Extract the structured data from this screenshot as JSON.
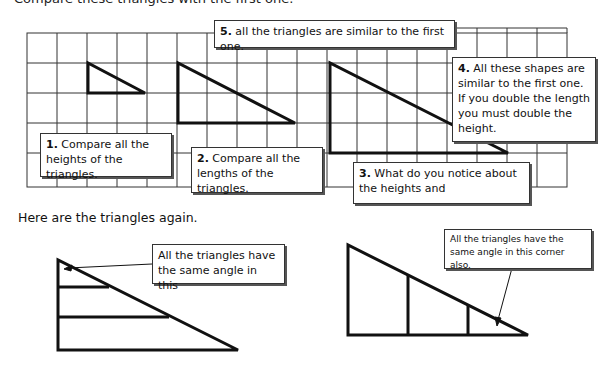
{
  "header": {
    "cutoff_text": "Compare these triangles with the first one."
  },
  "grid": {
    "left": 27,
    "top": 33,
    "cell": 30,
    "cols": 18,
    "rows": 5
  },
  "triangles_top": [
    {
      "points": "88,63 88,93 145,93"
    },
    {
      "points": "178,63 178,123 295,123"
    },
    {
      "points": "330,63 330,153 508,153"
    }
  ],
  "callouts": {
    "c1": {
      "num": "1.",
      "text": "Compare all the heights of the triangles."
    },
    "c2": {
      "num": "2.",
      "text": "Compare all the lengths of the triangles."
    },
    "c3": {
      "num": "3.",
      "text": "What do you notice about the heights and"
    },
    "c4": {
      "num": "4.",
      "text": "All these shapes are similar to the first one. If you double the length you must double the height."
    },
    "c5": {
      "num": "5.",
      "text": "all the triangles are similar to the first one."
    }
  },
  "caption": "Here are the triangles again.",
  "bottom": {
    "left_note": "All the triangles have the same angle in this",
    "right_note": "All the triangles have the same angle in this corner also."
  },
  "colors": {
    "line": "#111111",
    "grid": "#333333",
    "background": "#ffffff"
  }
}
